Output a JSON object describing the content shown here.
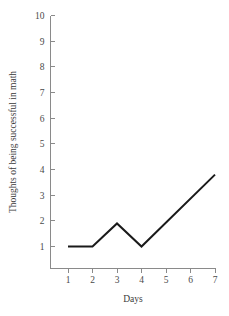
{
  "chart_data": {
    "type": "line",
    "title": "",
    "xlabel": "Days",
    "ylabel": "Thoughts of being successful in math",
    "x": [
      1,
      2,
      3,
      4,
      7
    ],
    "values": [
      1,
      1,
      1.9,
      1,
      3.8
    ],
    "xlim": [
      1,
      7
    ],
    "ylim": [
      1,
      10
    ],
    "xticks": [
      "1",
      "2",
      "3",
      "4",
      "5",
      "6",
      "7"
    ],
    "yticks": [
      "1",
      "2",
      "3",
      "4",
      "5",
      "6",
      "7",
      "8",
      "9",
      "10"
    ],
    "grid": false,
    "legend": false,
    "line_color": "#1a1a1a",
    "axis_color": "#8a8a8a",
    "text_color": "#3a3a3a",
    "background": "#ffffff"
  }
}
